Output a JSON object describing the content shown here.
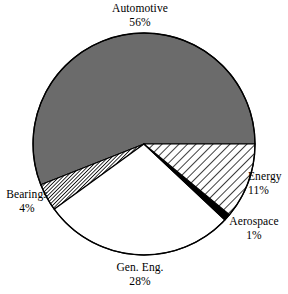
{
  "chart_data": {
    "type": "pie",
    "title": "",
    "subtitle": "",
    "xlabel": "",
    "ylabel": "",
    "legend_position": "none",
    "grid": false,
    "labels_show_percent": true,
    "categories": [
      "Automotive",
      "Energy",
      "Aerospace",
      "Gen. Eng.",
      "Bearings"
    ],
    "values": [
      56,
      11,
      1,
      28,
      4
    ],
    "units": "%",
    "total": 100,
    "slices": [
      {
        "name": "Automotive",
        "value": 56,
        "percent_text": "56%",
        "fill_style": "solid-gray",
        "color": "#6b6b6b",
        "start_angle_deg": 0,
        "end_angle_deg": 201.6
      },
      {
        "name": "Bearings",
        "value": 4,
        "percent_text": "4%",
        "fill_style": "dense-hatch",
        "color": "#000000",
        "start_angle_deg": 201.6,
        "end_angle_deg": 216.0
      },
      {
        "name": "Gen. Eng.",
        "value": 28,
        "percent_text": "28%",
        "fill_style": "white",
        "color": "#ffffff",
        "start_angle_deg": 216.0,
        "end_angle_deg": 316.8
      },
      {
        "name": "Aerospace",
        "value": 1,
        "percent_text": "1%",
        "fill_style": "solid-black",
        "color": "#000000",
        "start_angle_deg": 316.8,
        "end_angle_deg": 320.4
      },
      {
        "name": "Energy",
        "value": 11,
        "percent_text": "11%",
        "fill_style": "diagonal-hatch",
        "color": "#000000",
        "start_angle_deg": 320.4,
        "end_angle_deg": 360.0
      }
    ]
  },
  "labels": {
    "automotive": {
      "name": "Automotive",
      "percent": "56%"
    },
    "energy": {
      "name": "Energy",
      "percent": "11%"
    },
    "aerospace": {
      "name": "Aerospace",
      "percent": "1%"
    },
    "bearings": {
      "name": "Bearings",
      "percent": "4%"
    },
    "geneng": {
      "name": "Gen. Eng.",
      "percent": "28%"
    }
  },
  "colors": {
    "automotive_gray": "#6b6b6b",
    "outline": "#000000",
    "background": "#ffffff"
  }
}
